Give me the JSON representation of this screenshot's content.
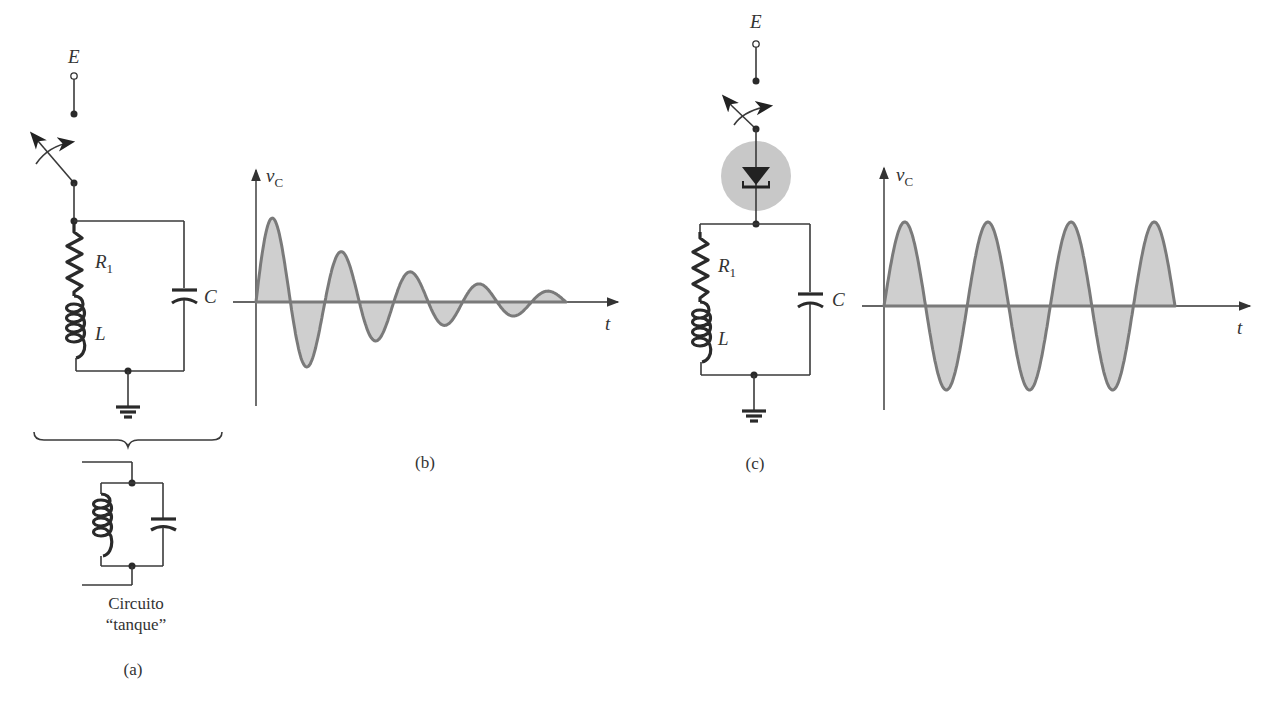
{
  "colors": {
    "ink": "#2a2a2a",
    "wave_stroke": "#7a7a7a",
    "wave_fill": "#cfcfcf",
    "diode_highlight": "#c8c8c8",
    "background": "#ffffff"
  },
  "panel_a": {
    "source_label": "E",
    "resistor_label": "R",
    "resistor_subscript": "1",
    "inductor_label": "L",
    "capacitor_label": "C",
    "tank_caption_line1": "Circuito",
    "tank_caption_line2": "“tanque”",
    "panel_caption": "(a)"
  },
  "panel_b": {
    "y_axis_label": "v",
    "y_axis_subscript": "C",
    "x_axis_label": "t",
    "panel_caption": "(b)"
  },
  "panel_c": {
    "source_label": "E",
    "resistor_label": "R",
    "resistor_subscript": "1",
    "inductor_label": "L",
    "capacitor_label": "C",
    "y_axis_label": "v",
    "y_axis_subscript": "C",
    "x_axis_label": "t",
    "panel_caption": "(c)"
  },
  "chart_data": [
    {
      "type": "line",
      "title": "Damped oscillation of tank circuit (b)",
      "xlabel": "t",
      "ylabel": "v_C",
      "description": "Exponentially decaying sinusoid, shaded between curve and axis",
      "peaks_relative": [
        1.0,
        -0.78,
        0.62,
        -0.5,
        0.41,
        -0.25,
        0.12,
        -0.06,
        0.05
      ],
      "cycles": 4.5,
      "grid": false
    },
    {
      "type": "line",
      "title": "Sustained oscillation (c)",
      "xlabel": "t",
      "ylabel": "v_C",
      "description": "Constant-amplitude sinusoid, shaded between curve and axis",
      "peaks_relative": [
        1.0,
        -1.0,
        1.0,
        -1.0,
        1.0,
        -1.0,
        1.0
      ],
      "cycles": 3.5,
      "grid": false
    }
  ]
}
